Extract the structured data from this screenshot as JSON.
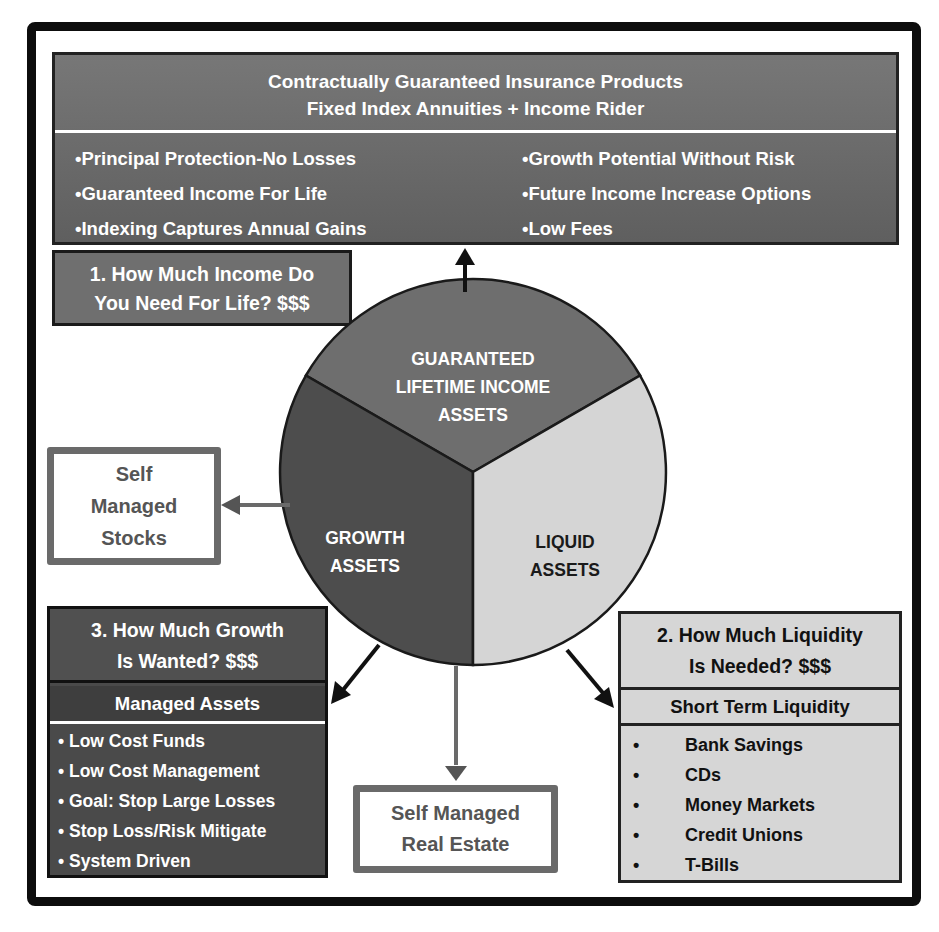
{
  "top_box": {
    "title_line1": "Contractually Guaranteed Insurance Products",
    "title_line2": "Fixed Index Annuities + Income Rider",
    "left_bullets": [
      "•Principal Protection-No Losses",
      "•Guaranteed Income For  Life",
      "•Indexing Captures Annual Gains"
    ],
    "right_bullets": [
      "•Growth Potential Without Risk",
      "•Future Income Increase Options",
      "•Low Fees"
    ]
  },
  "question_1": {
    "line1": "1. How Much Income Do",
    "line2": "You Need For Life? $$$"
  },
  "pie": {
    "segments": [
      {
        "lines": [
          "GUARANTEED",
          "LIFETIME INCOME",
          "ASSETS"
        ],
        "color": "#6e6e6e",
        "text_color": "#ffffff"
      },
      {
        "lines": [
          "GROWTH",
          "ASSETS"
        ],
        "color": "#4d4d4d",
        "text_color": "#ffffff"
      },
      {
        "lines": [
          "LIQUID",
          "ASSETS"
        ],
        "color": "#d5d5d5",
        "text_color": "#1a1a1a"
      }
    ]
  },
  "self_managed_stocks": {
    "lines": [
      "Self",
      "Managed",
      "Stocks"
    ]
  },
  "question_3": {
    "line1": "3. How Much Growth",
    "line2": "Is Wanted? $$$",
    "subheader": "Managed Assets",
    "items": [
      "• Low Cost Funds",
      "• Low Cost Management",
      "• Goal: Stop Large Losses",
      "• Stop Loss/Risk Mitigate",
      "• System Driven"
    ]
  },
  "question_2": {
    "line1": "2. How Much Liquidity",
    "line2": "Is Needed? $$$",
    "subheader": "Short Term Liquidity",
    "bullet": "•",
    "items": [
      "Bank Savings",
      "CDs",
      "Money Markets",
      "Credit Unions",
      "T-Bills"
    ]
  },
  "self_managed_real_estate": {
    "line1": "Self Managed",
    "line2": "Real Estate"
  },
  "colors": {
    "frame": "#0d0d0d",
    "dark_gray": "#4d4d4d",
    "mid_gray": "#6e6e6e",
    "light_gray": "#d5d5d5",
    "outline_gray": "#6a6a6a"
  }
}
